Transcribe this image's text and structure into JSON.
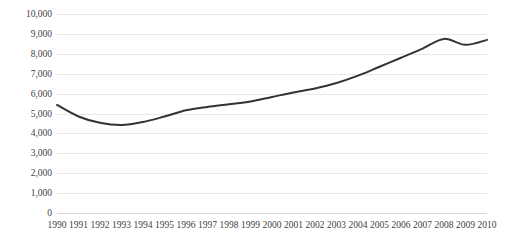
{
  "chart_data": {
    "type": "line",
    "title": "",
    "subtitle": "",
    "xlabel": "",
    "ylabel": "",
    "x": [
      1990,
      1991,
      1992,
      1993,
      1994,
      1995,
      1996,
      1997,
      1998,
      1999,
      2000,
      2001,
      2002,
      2003,
      2004,
      2005,
      2006,
      2007,
      2008,
      2009,
      2010
    ],
    "xtick_labels": [
      "1990",
      "1991",
      "1992",
      "1993",
      "1994",
      "1995",
      "1996",
      "1997",
      "1998",
      "1999",
      "2000",
      "2001",
      "2002",
      "2003",
      "2004",
      "2005",
      "2006",
      "2007",
      "2008",
      "2009",
      "2010"
    ],
    "values": [
      5430,
      4850,
      4530,
      4420,
      4570,
      4850,
      5160,
      5330,
      5460,
      5600,
      5830,
      6060,
      6260,
      6530,
      6900,
      7350,
      7800,
      8260,
      8750,
      8450,
      8700
    ],
    "ylim": [
      0,
      10000
    ],
    "ytick_values": [
      0,
      1000,
      2000,
      3000,
      4000,
      5000,
      6000,
      7000,
      8000,
      9000,
      10000
    ],
    "ytick_labels": [
      "0",
      "1,000",
      "2,000",
      "3,000",
      "4,000",
      "5,000",
      "6,000",
      "7,000",
      "8,000",
      "9,000",
      "10,000"
    ],
    "grid": true,
    "grid_axis": "y",
    "legend": false,
    "legend_position": "none",
    "series": [
      {
        "name": "",
        "color": "#333333",
        "line_width": 2,
        "markers": false,
        "smooth": true
      }
    ],
    "colors": {
      "line": "#333333",
      "gridline": "#e8e8e8",
      "baseline": "#d9d9d9",
      "tick_label": "#3f3f3f",
      "background": "#ffffff"
    }
  }
}
